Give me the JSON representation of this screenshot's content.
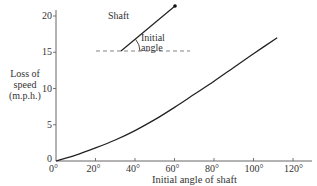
{
  "chart_data": {
    "type": "line",
    "title": "",
    "xlabel": "Initial angle of shaft",
    "ylabel": "Loss of speed (m.p.h.)",
    "ylabel_lines": [
      "Loss of",
      "speed",
      "(m.p.h.)"
    ],
    "xlim": [
      0,
      120
    ],
    "ylim": [
      0,
      20
    ],
    "x_ticks": [
      0,
      20,
      40,
      60,
      80,
      100,
      120
    ],
    "x_tick_labels": [
      "0°",
      "20°",
      "40°",
      "60°",
      "80°",
      "100°",
      "120°"
    ],
    "y_ticks": [
      0,
      5,
      10,
      15,
      20
    ],
    "y_tick_labels": [
      "0",
      "5",
      "10",
      "15",
      "20"
    ],
    "grid": false,
    "legend": null,
    "series": [
      {
        "name": "Loss of speed",
        "x": [
          0,
          10,
          20,
          30,
          40,
          50,
          60,
          70,
          80,
          90,
          100,
          112
        ],
        "y": [
          0,
          0.8,
          1.8,
          2.9,
          4.2,
          5.7,
          7.4,
          9.2,
          11.0,
          12.9,
          14.8,
          17.0
        ]
      }
    ],
    "annotations": {
      "inset_diagram": {
        "shaft_label": "Shaft",
        "angle_label_lines": [
          "Initial",
          "angle"
        ],
        "description": "Shaft line rising from dashed horizontal reference, with arc marking the initial angle"
      }
    }
  },
  "colors": {
    "axis": "#555555",
    "curve": "#222222",
    "text": "#333333"
  }
}
